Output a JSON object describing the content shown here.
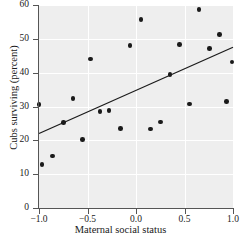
{
  "chart_data": {
    "type": "scatter",
    "title": "",
    "xlabel": "Maternal social status",
    "ylabel": "Cubs surviving (percent)",
    "xlim": [
      -1.0,
      1.0
    ],
    "ylim": [
      0,
      60
    ],
    "xticks": [
      -1.0,
      -0.5,
      0.0,
      0.5,
      1.0
    ],
    "xtick_labels": [
      "−1.0",
      "−0.5",
      "0.0",
      "0.5",
      "1.0"
    ],
    "yticks": [
      0,
      10,
      20,
      30,
      40,
      50,
      60
    ],
    "ytick_labels": [
      "0",
      "10",
      "20",
      "30",
      "40",
      "50",
      "60"
    ],
    "grid": true,
    "grid_color": "#ffffff",
    "plot_background": "#eeeeee",
    "point_color": "#1a1a1a",
    "line_color": "#1a1a1a",
    "legend": null,
    "points": [
      {
        "x": -1.0,
        "y": 30.6
      },
      {
        "x": -0.97,
        "y": 12.9
      },
      {
        "x": -0.86,
        "y": 15.4
      },
      {
        "x": -0.75,
        "y": 25.2
      },
      {
        "x": -0.65,
        "y": 32.4
      },
      {
        "x": -0.55,
        "y": 20.3
      },
      {
        "x": -0.47,
        "y": 44.0
      },
      {
        "x": -0.37,
        "y": 28.5
      },
      {
        "x": -0.28,
        "y": 28.8
      },
      {
        "x": -0.16,
        "y": 23.5
      },
      {
        "x": -0.06,
        "y": 48.0
      },
      {
        "x": 0.05,
        "y": 55.7
      },
      {
        "x": 0.15,
        "y": 23.3
      },
      {
        "x": 0.25,
        "y": 25.4
      },
      {
        "x": 0.35,
        "y": 39.4
      },
      {
        "x": 0.45,
        "y": 48.4
      },
      {
        "x": 0.55,
        "y": 30.7
      },
      {
        "x": 0.65,
        "y": 58.6
      },
      {
        "x": 0.76,
        "y": 47.2
      },
      {
        "x": 0.86,
        "y": 51.2
      },
      {
        "x": 0.93,
        "y": 31.4
      },
      {
        "x": 0.99,
        "y": 43.1
      }
    ],
    "trend_line": {
      "type": "linear-regression",
      "x_start": -1.0,
      "y_start": 22.0,
      "x_end": 1.0,
      "y_end": 47.5
    }
  }
}
